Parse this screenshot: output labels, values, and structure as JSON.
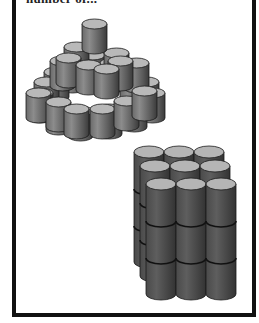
{
  "caption": "number of...",
  "colors": {
    "border": "#111111",
    "cylinder_top": "#b8b8b8",
    "cylinder_side_light": "#8a8a8a",
    "cylinder_side_dark": "#3e3e3e",
    "outline": "#1a1a1a"
  },
  "figures": [
    {
      "name": "pyramid-stack",
      "description": "Pyramid of cylinders in stepped layers",
      "layers": [
        {
          "level": 1,
          "count": 16
        },
        {
          "level": 2,
          "count": 9
        },
        {
          "level": 3,
          "count": 4
        },
        {
          "level": 4,
          "count": 1
        }
      ]
    },
    {
      "name": "cube-stack",
      "description": "3x3 grid of cylinders stacked 3 high",
      "rows": 3,
      "columns": 3,
      "height": 3
    }
  ]
}
